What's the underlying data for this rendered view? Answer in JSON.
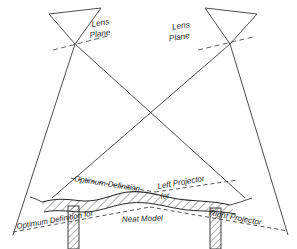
{
  "figure": {
    "type": "line-diagram",
    "background_color": "#ffffff",
    "ink_color": "#3a3a3a"
  },
  "labels": {
    "lens_plane_left_line1": "Lens",
    "lens_plane_left_line2": "Plane",
    "lens_plane_right_line1": "Lens",
    "lens_plane_right_line2": "Plane",
    "optimum_definition_upper": "Optimum Definition",
    "left_projector": "Left Projector",
    "for_upper": "for",
    "optimum_definition_lower": "Optimum Definition for",
    "right_projector": "Right Projector",
    "neat_model": "Neat Model"
  },
  "geometry": {
    "left_lens_node": {
      "x": 75,
      "y": 44
    },
    "right_lens_node": {
      "x": 230,
      "y": 44
    },
    "cone_crossing": {
      "x": 151,
      "y": 117
    },
    "left_cone_base_left": {
      "x": 13,
      "y": 235
    },
    "left_cone_base_right": {
      "x": 245,
      "y": 198
    },
    "right_cone_base_left": {
      "x": 52,
      "y": 198
    },
    "right_cone_base_right": {
      "x": 288,
      "y": 235
    },
    "ground_column_left_x": 73,
    "ground_column_right_x": 215,
    "ground_baseline_y": 249
  },
  "colors": {
    "ink": "#3a3a3a",
    "hatch": "#4a4a4a",
    "paper": "#ffffff"
  }
}
